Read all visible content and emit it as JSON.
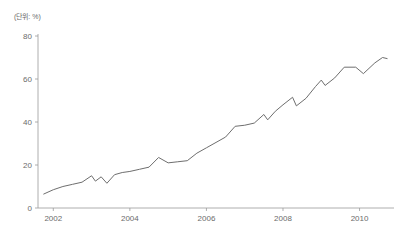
{
  "unit_label": "(단위: %)",
  "chart_data": {
    "type": "line",
    "title": "",
    "subtitle": "",
    "xlabel": "",
    "ylabel": "",
    "unit_note": "(단위: %)",
    "grid": false,
    "legend": "none",
    "xlim": [
      2001.6,
      2010.9
    ],
    "ylim": [
      0,
      80
    ],
    "yticks": [
      0,
      20,
      40,
      60,
      80
    ],
    "ytick_labels": [
      "0",
      "20",
      "40",
      "60",
      "80"
    ],
    "xticks": [
      2002,
      2004,
      2006,
      2008,
      2010
    ],
    "xtick_labels": [
      "2002",
      "2004",
      "2006",
      "2008",
      "2010"
    ],
    "series": [
      {
        "name": "value",
        "color": "#6e6e6e",
        "x": [
          2001.75,
          2002.0,
          2002.25,
          2002.5,
          2002.75,
          2003.0,
          2003.25,
          2003.5,
          2003.75,
          2004.0,
          2004.25,
          2004.5,
          2004.75,
          2005.0,
          2005.25,
          2005.5,
          2005.75,
          2006.0,
          2006.25,
          2006.5,
          2006.75,
          2007.0,
          2007.25,
          2007.5,
          2007.75,
          2008.0,
          2008.25,
          2008.5,
          2008.75,
          2009.0,
          2009.25,
          2009.5,
          2009.75,
          2010.0,
          2010.25,
          2010.5,
          2010.7
        ],
        "y": [
          6.5,
          8.5,
          10.0,
          11.0,
          12.5,
          14.5,
          12.5,
          14.0,
          11.5,
          15.5,
          17.0,
          17.5,
          19.0,
          23.5,
          21.0,
          21.5,
          22.0,
          25.5,
          28.5,
          31.0,
          33.0,
          38.0,
          38.5,
          39.5,
          43.5,
          41.5,
          45.5,
          48.0,
          51.5,
          51.0,
          56.5,
          59.5,
          57.0,
          60.5,
          65.5,
          65.5,
          62.5
        ],
        "y_tail": [
          67.5,
          70.0,
          69.0
        ]
      }
    ],
    "points": [
      {
        "x": 2001.75,
        "y": 6.5
      },
      {
        "x": 2002.0,
        "y": 8.5
      },
      {
        "x": 2002.25,
        "y": 10.0
      },
      {
        "x": 2002.5,
        "y": 11.0
      },
      {
        "x": 2002.75,
        "y": 12.0
      },
      {
        "x": 2003.0,
        "y": 15.0
      },
      {
        "x": 2003.1,
        "y": 12.5
      },
      {
        "x": 2003.25,
        "y": 14.5
      },
      {
        "x": 2003.4,
        "y": 11.5
      },
      {
        "x": 2003.6,
        "y": 15.5
      },
      {
        "x": 2003.8,
        "y": 16.5
      },
      {
        "x": 2004.0,
        "y": 17.0
      },
      {
        "x": 2004.25,
        "y": 18.0
      },
      {
        "x": 2004.5,
        "y": 19.0
      },
      {
        "x": 2004.75,
        "y": 23.5
      },
      {
        "x": 2005.0,
        "y": 21.0
      },
      {
        "x": 2005.25,
        "y": 21.5
      },
      {
        "x": 2005.5,
        "y": 22.0
      },
      {
        "x": 2005.75,
        "y": 25.5
      },
      {
        "x": 2006.0,
        "y": 28.0
      },
      {
        "x": 2006.25,
        "y": 30.5
      },
      {
        "x": 2006.5,
        "y": 33.0
      },
      {
        "x": 2006.75,
        "y": 38.0
      },
      {
        "x": 2007.0,
        "y": 38.5
      },
      {
        "x": 2007.25,
        "y": 39.5
      },
      {
        "x": 2007.5,
        "y": 43.5
      },
      {
        "x": 2007.6,
        "y": 41.0
      },
      {
        "x": 2007.8,
        "y": 45.0
      },
      {
        "x": 2008.0,
        "y": 48.0
      },
      {
        "x": 2008.25,
        "y": 51.5
      },
      {
        "x": 2008.35,
        "y": 47.5
      },
      {
        "x": 2008.6,
        "y": 51.0
      },
      {
        "x": 2008.85,
        "y": 56.5
      },
      {
        "x": 2009.0,
        "y": 59.5
      },
      {
        "x": 2009.1,
        "y": 57.0
      },
      {
        "x": 2009.35,
        "y": 60.5
      },
      {
        "x": 2009.6,
        "y": 65.5
      },
      {
        "x": 2009.9,
        "y": 65.5
      },
      {
        "x": 2010.1,
        "y": 62.5
      },
      {
        "x": 2010.4,
        "y": 67.5
      },
      {
        "x": 2010.6,
        "y": 70.0
      },
      {
        "x": 2010.72,
        "y": 69.5
      }
    ]
  }
}
